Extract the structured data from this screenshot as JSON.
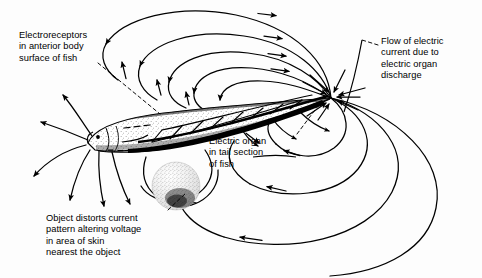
{
  "figure": {
    "type": "scientific-diagram",
    "background_color": "#fdfdfd",
    "ink_color": "#000000",
    "width": 482,
    "height": 278
  },
  "labels": {
    "electroreceptors": "Electroreceptors\nin anterior body\nsurface of fish",
    "flow": "Flow of electric\ncurrent due to\nelectric organ\ndischarge",
    "electric_organ": "Electric organ\nin tail section\nof fish",
    "object": "Object distorts current\npattern altering voltage\nin area of skin\nnearest the object"
  },
  "elements": {
    "fish_body": "fish-body",
    "fish_eye": "fish-eye",
    "electric_organ": "electric-organ-band",
    "object": "distorting-object-sphere",
    "tail_tip": "current-convergence-point"
  },
  "geometry": {
    "tail_tip": {
      "x": 331,
      "y": 98
    },
    "head_tip": {
      "x": 88,
      "y": 143
    },
    "object_center": {
      "x": 176,
      "y": 186
    },
    "object_radius": 24
  }
}
